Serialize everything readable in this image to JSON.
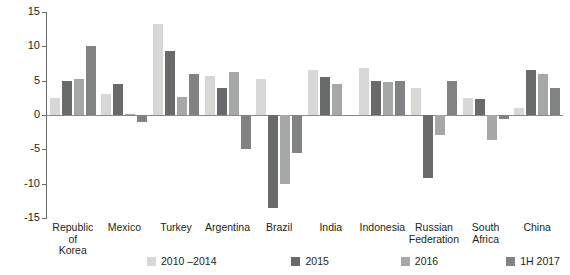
{
  "chart_data": {
    "type": "bar",
    "title": "",
    "subtitle": "",
    "xlabel": "",
    "ylabel": "",
    "ylim": [
      -15,
      15
    ],
    "yticks": [
      15,
      10,
      5,
      0,
      -5,
      -10,
      -15
    ],
    "ytick_labels": [
      "15",
      "10",
      "5",
      "0",
      "-5",
      "-10",
      "-15"
    ],
    "grid": false,
    "legend_position": "bottom",
    "categories": [
      "Republic\nof\nKorea",
      "Mexico",
      "Turkey",
      "Argentina",
      "Brazil",
      "India",
      "Indonesia",
      "Russian\nFederation",
      "South\nAfrica",
      "China"
    ],
    "category_labels": [
      [
        "Republic",
        "of",
        "Korea"
      ],
      [
        "Mexico"
      ],
      [
        "Turkey"
      ],
      [
        "Argentina"
      ],
      [
        "Brazil"
      ],
      [
        "India"
      ],
      [
        "Indonesia"
      ],
      [
        "Russian",
        "Federation"
      ],
      [
        "South",
        "Africa"
      ],
      [
        "China"
      ]
    ],
    "series": [
      {
        "name": "2010 –2014",
        "color": "#d7d7d5",
        "values": [
          2.5,
          3.1,
          13.2,
          5.7,
          5.3,
          6.5,
          6.8,
          3.9,
          2.5,
          1.0
        ]
      },
      {
        "name": "2015",
        "color": "#696a6b",
        "values": [
          5.0,
          4.5,
          9.3,
          4.0,
          -13.6,
          5.5,
          5.0,
          -9.2,
          2.3,
          6.5
        ]
      },
      {
        "name": "2016",
        "color": "#a6a8a8",
        "values": [
          5.3,
          0.1,
          2.6,
          6.2,
          -10.0,
          4.5,
          4.8,
          -2.9,
          -3.7,
          6.0
        ]
      },
      {
        "name": "1H 2017",
        "color": "#808283",
        "values": [
          10.0,
          -1.0,
          6.0,
          -5.0,
          -5.5,
          -0.2,
          5.0,
          5.0,
          -0.6,
          4.0
        ]
      }
    ]
  },
  "legend": {
    "items": [
      {
        "label": "2010 –2014"
      },
      {
        "label": "2015"
      },
      {
        "label": "2016"
      },
      {
        "label": "1H 2017"
      }
    ]
  }
}
